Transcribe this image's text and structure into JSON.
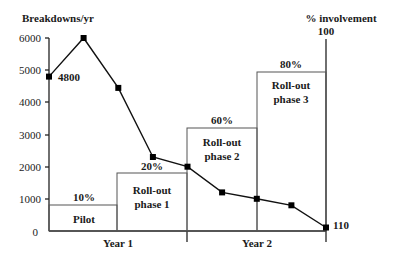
{
  "chart_data": {
    "type": "line",
    "title": "",
    "ylabel": "Breakdowns/yr",
    "y2label": "% involvement",
    "ylim": [
      0,
      6000
    ],
    "y2lim": [
      0,
      100
    ],
    "yticks": [
      "0",
      "1000",
      "2000",
      "3000",
      "4000",
      "5000",
      "6000"
    ],
    "y2ticks": [
      "100"
    ],
    "xlabels": [
      "Year 1",
      "Year 2"
    ],
    "series": [
      {
        "name": "Breakdowns/yr",
        "type": "line",
        "x": [
          0,
          1,
          2,
          3,
          4,
          5,
          6,
          7,
          8
        ],
        "values": [
          4800,
          6000,
          4450,
          2300,
          2000,
          1200,
          1000,
          800,
          110
        ],
        "point_labels": {
          "0": "4800",
          "8": "110"
        }
      }
    ],
    "phases": [
      {
        "name": "Pilot",
        "label": "Pilot",
        "percent_label": "10%",
        "percent": 10,
        "x_start": 0,
        "x_end": 2
      },
      {
        "name": "Roll-out phase 1",
        "label_line1": "Roll-out",
        "label_line2": "phase 1",
        "percent_label": "20%",
        "percent": 20,
        "x_start": 2,
        "x_end": 4
      },
      {
        "name": "Roll-out phase 2",
        "label_line1": "Roll-out",
        "label_line2": "phase 2",
        "percent_label": "60%",
        "percent": 60,
        "x_start": 4,
        "x_end": 6
      },
      {
        "name": "Roll-out phase 3",
        "label_line1": "Roll-out",
        "label_line2": "phase 3",
        "percent_label": "80%",
        "percent": 80,
        "x_start": 6,
        "x_end": 8
      }
    ],
    "grid": false,
    "legend": "none"
  }
}
